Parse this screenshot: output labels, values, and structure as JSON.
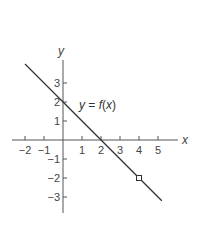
{
  "chart_data": {
    "type": "line",
    "title": "",
    "xlabel": "x",
    "ylabel": "y",
    "xlim": [
      -2.7,
      6.0
    ],
    "ylim": [
      -3.8,
      4.2
    ],
    "grid": false,
    "x_ticks": [
      -2,
      -1,
      1,
      2,
      3,
      4,
      5
    ],
    "x_tick_labels": [
      "−2",
      "−1",
      "1",
      "2",
      "3",
      "4",
      "5"
    ],
    "y_ticks": [
      3,
      2,
      1,
      -1,
      -2,
      -3
    ],
    "y_tick_labels": [
      "3",
      "2",
      "1",
      "−1",
      "−2",
      "−3"
    ],
    "series": [
      {
        "name": "y = f(x)",
        "equation": "y = 2 - x",
        "x": [
          -2,
          5.2
        ],
        "y": [
          4,
          -3.2
        ],
        "color": "#333333"
      }
    ],
    "annotations": [
      {
        "type": "label",
        "text_parts": [
          "y",
          " = ",
          "f",
          "(",
          "x",
          ")"
        ],
        "x": 0.85,
        "y": 1.85
      },
      {
        "type": "open-circle",
        "x": 4,
        "y": -2,
        "meaning": "point excluded from domain"
      }
    ]
  },
  "labels": {
    "x_axis": "x",
    "y_axis": "y",
    "fn_y": "y",
    "fn_eq": " = ",
    "fn_f": "f",
    "fn_open": "(",
    "fn_x": "x",
    "fn_close": ")"
  },
  "colors": {
    "line": "#333333",
    "axis": "#555555",
    "text": "#444444"
  }
}
